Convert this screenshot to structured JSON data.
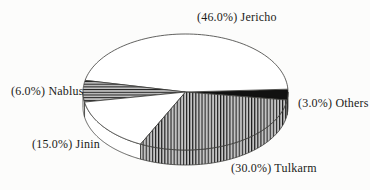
{
  "chart_data": {
    "type": "pie",
    "style": "3d-pie-hatched",
    "title": "",
    "total": 100,
    "slices": [
      {
        "name": "others",
        "label": "Others",
        "value": 3.0,
        "display": "(3.0%) Others",
        "pattern": "black",
        "wall": "black"
      },
      {
        "name": "jericho",
        "label": "Jericho",
        "value": 46.0,
        "display": "(46.0%) Jericho",
        "pattern": "white",
        "wall": "white"
      },
      {
        "name": "nablus",
        "label": "Nablus",
        "value": 6.0,
        "display": "(6.0%) Nablus",
        "pattern": "hlines",
        "wall": "white"
      },
      {
        "name": "jinin",
        "label": "Jinin",
        "value": 15.0,
        "display": "(15.0%) Jinin",
        "pattern": "white",
        "wall": "white"
      },
      {
        "name": "tulkarm",
        "label": "Tulkarm",
        "value": 30.0,
        "display": "(30.0%) Tulkarm",
        "pattern": "vlines",
        "wall": "vlines"
      }
    ],
    "labels": {
      "jericho": "(46.0%) Jericho",
      "nablus": "(6.0%) Nablus",
      "others": "(3.0%) Others",
      "jinin": "(15.0%) Jinin",
      "tulkarm": "(30.0%) Tulkarm"
    },
    "legend_position": "labels-around-pie",
    "geometry": {
      "cx": 185.5,
      "cy": 92,
      "rx": 102.5,
      "ry": 58,
      "depth": 15,
      "start_deg": -8,
      "direction": "ccw"
    },
    "colors": {
      "outline": "#3b3b38",
      "slice_black": "#111111",
      "stripe_bg": "#c4c4c4",
      "stripe_line": "#1c1c1c",
      "ink": "#1b1b18",
      "background": "#fcfcfb"
    }
  }
}
